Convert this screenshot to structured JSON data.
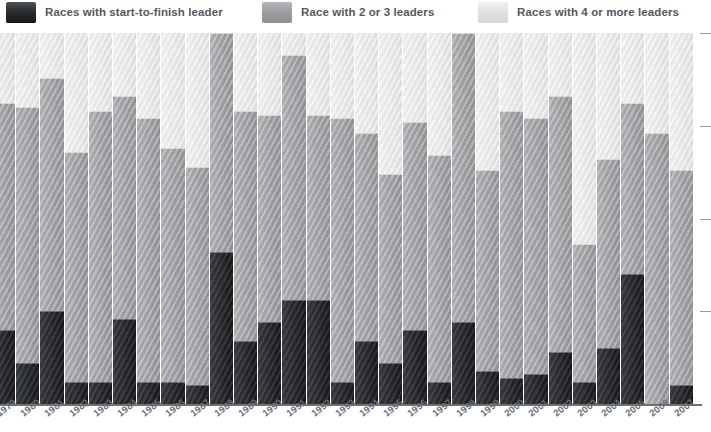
{
  "legend": {
    "items": [
      {
        "label": "Races with start-to-finish leader",
        "swatch": "dark-swatch-icon",
        "color": "#232528",
        "x": 6
      },
      {
        "label": "Race with 2 or 3 leaders",
        "swatch": "mid-gray-swatch-icon",
        "color": "#9a9c9f",
        "x": 262
      },
      {
        "label": "Races with 4 or more leaders",
        "swatch": "light-gray-swatch-icon",
        "color": "#e4e4e5",
        "x": 478
      }
    ]
  },
  "axis": {
    "y_ticks_percent": [
      100,
      75,
      50,
      25,
      0
    ],
    "baseline_color": "#6e7174",
    "tick_color": "#9a9da0"
  },
  "chart_data": {
    "type": "bar",
    "title": "",
    "subtitle": "",
    "xlabel": "",
    "ylabel": "",
    "stacked": true,
    "normalized_percent": true,
    "ylim": [
      0,
      100
    ],
    "grid": false,
    "legend_position": "top",
    "categories": [
      "1979",
      "1980",
      "1981",
      "1982",
      "1983",
      "1984",
      "1985",
      "1986",
      "1987",
      "1988",
      "1989",
      "1990",
      "1991",
      "1992",
      "1993",
      "1994",
      "1995",
      "1996",
      "1997",
      "1998",
      "1999",
      "2000",
      "2001",
      "2002",
      "2003",
      "2004",
      "2005",
      "2006",
      "2007"
    ],
    "series": [
      {
        "name": "Races with start-to-finish leader",
        "color": "#232528",
        "values": [
          20,
          11,
          25,
          6,
          6,
          23,
          6,
          6,
          5,
          41,
          17,
          22,
          28,
          28,
          6,
          17,
          11,
          20,
          6,
          22,
          9,
          7,
          8,
          14,
          6,
          15,
          35,
          0,
          5
        ]
      },
      {
        "name": "Race with 2 or 3 leaders",
        "color": "#9a9c9f",
        "values": [
          61,
          69,
          63,
          62,
          73,
          60,
          71,
          63,
          59,
          59,
          62,
          56,
          66,
          50,
          71,
          56,
          51,
          56,
          61,
          78,
          54,
          72,
          69,
          69,
          37,
          51,
          46,
          73,
          58
        ]
      },
      {
        "name": "Races with 4 or more leaders",
        "color": "#e4e4e5",
        "values": [
          19,
          20,
          12,
          32,
          21,
          17,
          23,
          31,
          36,
          0,
          21,
          22,
          6,
          22,
          23,
          27,
          38,
          24,
          33,
          0,
          37,
          21,
          23,
          17,
          57,
          34,
          19,
          27,
          37
        ]
      }
    ]
  },
  "layout": {
    "bar_width": 23.2,
    "bar_pitch": 24.2,
    "first_bar_left": -8,
    "plot_top": 33,
    "plot_bottom": 404
  }
}
